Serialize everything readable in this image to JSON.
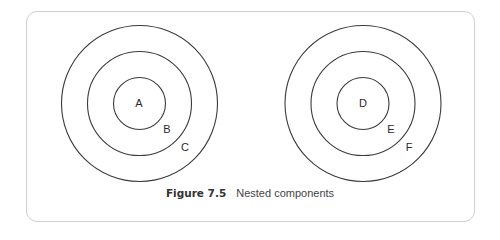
{
  "figure": {
    "number": "Figure 7.5",
    "title": "Nested components"
  },
  "groups": [
    {
      "name": "left",
      "center": [
        139.5,
        103.5
      ],
      "circles": [
        {
          "label": "A",
          "r": 26,
          "label_pos": [
            139,
            104
          ]
        },
        {
          "label": "B",
          "r": 52,
          "label_pos": [
            167,
            130
          ]
        },
        {
          "label": "C",
          "r": 78,
          "label_pos": [
            185,
            148
          ]
        }
      ]
    },
    {
      "name": "right",
      "center": [
        363,
        103.5
      ],
      "circles": [
        {
          "label": "D",
          "r": 26,
          "label_pos": [
            363,
            104
          ]
        },
        {
          "label": "E",
          "r": 52,
          "label_pos": [
            391,
            130
          ]
        },
        {
          "label": "F",
          "r": 78,
          "label_pos": [
            409,
            148
          ]
        }
      ]
    }
  ],
  "colors": {
    "stroke": "#3a3a3a",
    "frame": "#cfcfcf"
  }
}
